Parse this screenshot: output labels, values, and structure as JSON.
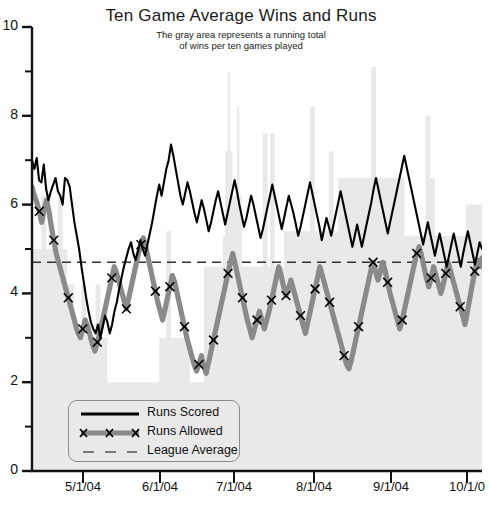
{
  "chart_data": {
    "type": "line",
    "title": "Ten Game Average Wins and Runs",
    "subtitle_line1": "The gray area represents a running total",
    "subtitle_line2": "of wins per ten games played",
    "xlabel": "",
    "ylabel": "",
    "ylim": [
      0,
      10
    ],
    "y_major_ticks": [
      0,
      2,
      4,
      6,
      8,
      10
    ],
    "y_minor_ticks": [
      1,
      3,
      5,
      7,
      9
    ],
    "y_ticklabels": [
      "0",
      "2",
      "4",
      "6",
      "8",
      "10"
    ],
    "x_ticklabels": [
      "5/1/04",
      "6/1/04",
      "7/1/04",
      "8/1/04",
      "9/1/04",
      "10/1/0"
    ],
    "x_tick_positions_px": [
      83,
      160,
      234,
      314,
      391,
      467
    ],
    "grid": false,
    "legend_position": "lower-left",
    "colors": {
      "runs_scored": "#000000",
      "runs_allowed": "#808080",
      "league_average": "#333333",
      "wins_area": "#e9e9e9",
      "axis": "#111111",
      "background": "#ffffff"
    },
    "annotations": [
      "The gray area represents a running total of wins per ten games played"
    ],
    "series": [
      {
        "name": "Runs Scored",
        "style": "solid-black-line",
        "marker": "none",
        "values": [
          7.0,
          6.8,
          7.05,
          6.55,
          6.5,
          6.9,
          6.35,
          6.1,
          6.3,
          6.45,
          6.6,
          6.3,
          6.2,
          6.0,
          6.6,
          6.55,
          6.4,
          6.0,
          5.6,
          5.3,
          5.0,
          4.6,
          4.25,
          3.9,
          3.6,
          3.35,
          3.2,
          3.1,
          3.3,
          3.0,
          3.25,
          3.5,
          3.35,
          3.1,
          3.3,
          3.6,
          3.8,
          4.1,
          4.35,
          4.6,
          4.8,
          5.0,
          5.15,
          4.9,
          4.75,
          4.95,
          5.2,
          5.0,
          4.85,
          5.1,
          5.35,
          5.6,
          5.9,
          6.2,
          6.45,
          6.2,
          6.5,
          6.8,
          7.0,
          7.35,
          7.1,
          6.8,
          6.5,
          6.2,
          6.0,
          6.25,
          6.5,
          6.3,
          6.05,
          5.8,
          5.6,
          5.85,
          6.1,
          5.9,
          5.65,
          5.4,
          5.6,
          5.85,
          6.1,
          6.3,
          6.05,
          5.8,
          5.55,
          5.8,
          6.05,
          6.3,
          6.55,
          6.3,
          6.0,
          5.75,
          5.5,
          5.7,
          5.95,
          6.2,
          6.0,
          5.75,
          5.5,
          5.25,
          5.45,
          5.7,
          5.95,
          6.2,
          6.45,
          6.2,
          5.95,
          5.7,
          5.45,
          5.7,
          5.95,
          6.2,
          6.0,
          5.8,
          5.55,
          5.3,
          5.5,
          5.75,
          6.0,
          6.25,
          6.5,
          6.25,
          6.0,
          5.75,
          5.5,
          5.2,
          5.45,
          5.7,
          5.5,
          5.3,
          5.55,
          5.8,
          6.05,
          6.3,
          6.05,
          5.8,
          5.55,
          5.3,
          5.05,
          5.3,
          5.55,
          5.3,
          5.05,
          5.3,
          5.55,
          5.8,
          6.05,
          6.35,
          6.6,
          6.35,
          6.1,
          5.85,
          5.6,
          5.35,
          5.6,
          5.85,
          6.1,
          6.35,
          6.6,
          6.85,
          7.1,
          6.85,
          6.6,
          6.35,
          6.1,
          5.85,
          5.6,
          5.35,
          5.1,
          5.35,
          5.6,
          5.35,
          5.1,
          4.85,
          5.1,
          5.35,
          5.1,
          4.85,
          4.6,
          4.85,
          5.1,
          5.35,
          5.1,
          4.85,
          4.6,
          4.9,
          5.15,
          5.4,
          5.15,
          4.9,
          4.65,
          4.9,
          5.15,
          5.0
        ]
      },
      {
        "name": "Runs Allowed",
        "style": "thick-gray-line",
        "marker": "x",
        "values": [
          6.4,
          6.2,
          6.05,
          5.85,
          5.6,
          5.9,
          6.1,
          5.85,
          5.5,
          5.2,
          4.9,
          4.7,
          4.5,
          4.3,
          4.1,
          3.9,
          3.7,
          3.5,
          3.3,
          3.1,
          3.0,
          3.2,
          3.4,
          3.25,
          3.05,
          2.85,
          2.7,
          2.9,
          3.1,
          3.35,
          3.6,
          3.85,
          4.1,
          4.35,
          4.6,
          4.45,
          4.25,
          4.05,
          3.85,
          3.65,
          3.9,
          4.15,
          4.4,
          4.65,
          4.9,
          5.1,
          5.25,
          5.05,
          4.8,
          4.55,
          4.3,
          4.05,
          3.8,
          3.6,
          3.4,
          3.65,
          3.9,
          4.15,
          4.4,
          4.25,
          4.0,
          3.75,
          3.5,
          3.25,
          3.0,
          2.8,
          2.6,
          2.4,
          2.25,
          2.4,
          2.6,
          2.35,
          2.2,
          2.45,
          2.7,
          2.95,
          3.2,
          3.45,
          3.7,
          3.95,
          4.2,
          4.45,
          4.7,
          4.9,
          4.65,
          4.4,
          4.15,
          3.9,
          3.65,
          3.4,
          3.2,
          3.0,
          3.2,
          3.4,
          3.6,
          3.4,
          3.2,
          3.4,
          3.6,
          3.85,
          4.1,
          4.35,
          4.6,
          4.4,
          4.15,
          3.95,
          4.1,
          4.3,
          4.1,
          3.9,
          3.7,
          3.5,
          3.3,
          3.1,
          3.35,
          3.6,
          3.85,
          4.1,
          4.35,
          4.6,
          4.4,
          4.2,
          4.0,
          3.8,
          3.6,
          3.4,
          3.2,
          3.0,
          2.8,
          2.6,
          2.4,
          2.3,
          2.5,
          2.75,
          3.0,
          3.25,
          3.5,
          3.75,
          4.0,
          4.25,
          4.5,
          4.7,
          4.5,
          4.3,
          4.5,
          4.7,
          4.5,
          4.25,
          4.0,
          3.8,
          3.6,
          3.4,
          3.2,
          3.4,
          3.65,
          3.9,
          4.15,
          4.4,
          4.65,
          4.9,
          5.05,
          4.85,
          4.6,
          4.35,
          4.15,
          4.35,
          4.6,
          4.4,
          4.2,
          4.0,
          4.2,
          4.45,
          4.7,
          4.5,
          4.3,
          4.1,
          3.9,
          3.7,
          3.5,
          3.3,
          3.6,
          3.9,
          4.2,
          4.5,
          4.75,
          4.6,
          4.8
        ]
      },
      {
        "name": "League Average",
        "style": "dashed-line",
        "marker": "none",
        "constant_value": 4.7
      },
      {
        "name": "Wins per ten games (gray area)",
        "style": "filled-area",
        "values": [
          5.0,
          5.0,
          5.0,
          5.0,
          6.2,
          6.2,
          5.0,
          5.0,
          5.0,
          5.0,
          5.0,
          6.2,
          6.2,
          5.0,
          5.0,
          4.2,
          4.2,
          4.2,
          3.0,
          3.0,
          3.0,
          4.2,
          4.2,
          3.0,
          3.0,
          3.0,
          3.0,
          4.2,
          4.2,
          3.0,
          3.0,
          3.0,
          2.0,
          2.0,
          2.0,
          2.0,
          2.0,
          2.0,
          2.0,
          2.0,
          2.0,
          2.0,
          2.0,
          2.0,
          2.0,
          2.0,
          2.0,
          2.0,
          2.0,
          2.0,
          2.0,
          2.0,
          2.0,
          2.0,
          3.0,
          3.0,
          3.0,
          5.4,
          5.4,
          3.0,
          3.0,
          3.0,
          3.0,
          3.0,
          3.0,
          3.0,
          3.0,
          2.0,
          2.0,
          2.0,
          2.0,
          2.0,
          2.0,
          4.6,
          4.6,
          4.6,
          4.6,
          4.6,
          4.6,
          4.6,
          4.6,
          5.3,
          7.2,
          9.0,
          7.2,
          6.2,
          6.2,
          8.2,
          6.2,
          4.6,
          4.6,
          4.6,
          4.6,
          4.6,
          4.6,
          4.6,
          4.6,
          4.6,
          7.6,
          7.6,
          4.6,
          7.6,
          7.6,
          4.6,
          4.6,
          4.6,
          4.6,
          5.4,
          5.4,
          5.4,
          5.4,
          5.4,
          5.4,
          5.4,
          5.4,
          5.4,
          5.4,
          5.4,
          8.2,
          8.2,
          5.4,
          5.4,
          5.4,
          5.4,
          5.4,
          5.4,
          7.2,
          7.2,
          5.4,
          5.4,
          6.6,
          6.6,
          6.6,
          6.6,
          6.6,
          6.6,
          6.6,
          6.6,
          6.6,
          6.6,
          6.6,
          6.6,
          6.6,
          6.6,
          9.1,
          9.1,
          6.6,
          6.6,
          6.6,
          6.6,
          6.6,
          6.6,
          6.6,
          6.6,
          6.6,
          6.6,
          6.6,
          6.6,
          5.3,
          5.3,
          5.3,
          5.3,
          5.3,
          5.3,
          5.3,
          5.3,
          5.3,
          8.0,
          8.0,
          6.6,
          6.6,
          5.3,
          5.3,
          5.3,
          5.3,
          5.3,
          5.3,
          5.3,
          5.3,
          5.3,
          5.3,
          5.3,
          5.3,
          5.3,
          6.0,
          6.0,
          6.0,
          6.0,
          6.0,
          6.0,
          6.0
        ]
      }
    ],
    "legend": [
      {
        "label": "Runs Scored",
        "style": "solid-black-line"
      },
      {
        "label": "Runs Allowed",
        "style": "thick-gray-line-x-markers"
      },
      {
        "label": "League Average",
        "style": "dashed-line"
      }
    ]
  }
}
